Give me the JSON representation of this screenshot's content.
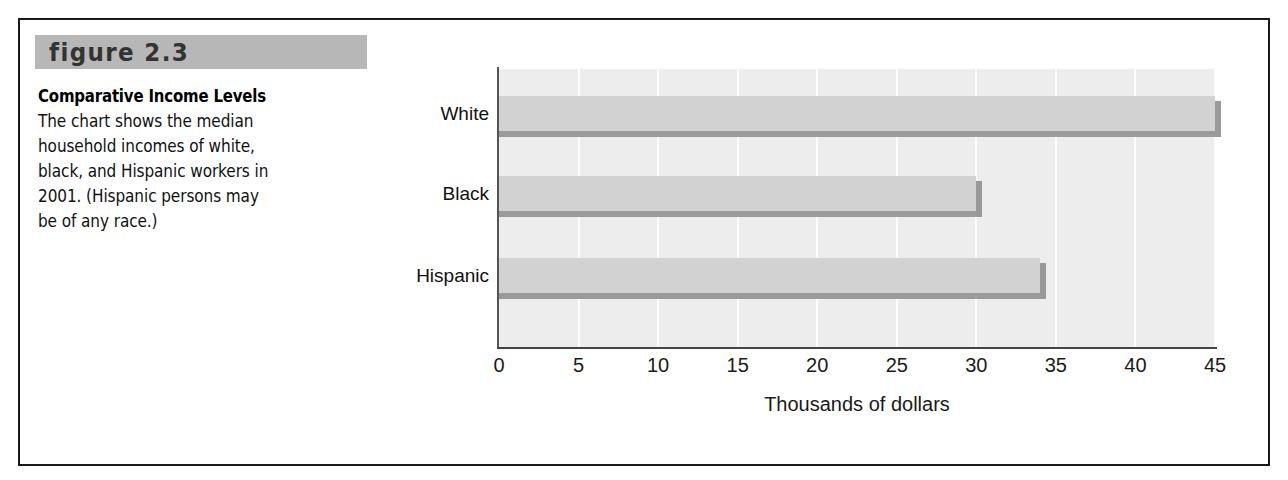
{
  "figure": {
    "tag": "figure 2.3",
    "title": "Comparative Income Levels",
    "body_lines": [
      "The chart shows the median",
      "household incomes of white,",
      "black, and Hispanic workers in",
      "2001. (Hispanic persons may",
      "be of any race.)"
    ]
  },
  "colors": {
    "tag_band": "#b7b7b7",
    "plot_background": "#ededed",
    "gridline": "#fcfcfc",
    "bar_fill": "#d2d2d2",
    "bar_shadow": "#9a9a9a",
    "axis_line": "#444444",
    "frame_border": "#1a1a1a",
    "text": "#000000"
  },
  "chart_data": {
    "type": "bar",
    "orientation": "horizontal",
    "title": "",
    "subtitle": "",
    "categories": [
      "White",
      "Black",
      "Hispanic"
    ],
    "values": [
      45.0,
      30.0,
      34.0
    ],
    "series": [
      {
        "name": "Median household income",
        "values": [
          45.0,
          30.0,
          34.0
        ]
      }
    ],
    "xlabel": "Thousands of dollars",
    "ylabel": "",
    "xlim": [
      0,
      45
    ],
    "ylim": null,
    "xticks": [
      0,
      5,
      10,
      15,
      20,
      25,
      30,
      35,
      40,
      45
    ],
    "xtick_labels": [
      "0",
      "5",
      "10",
      "15",
      "20",
      "25",
      "30",
      "35",
      "40",
      "45"
    ],
    "grid": "vertical",
    "legend": "none",
    "annotations": []
  }
}
